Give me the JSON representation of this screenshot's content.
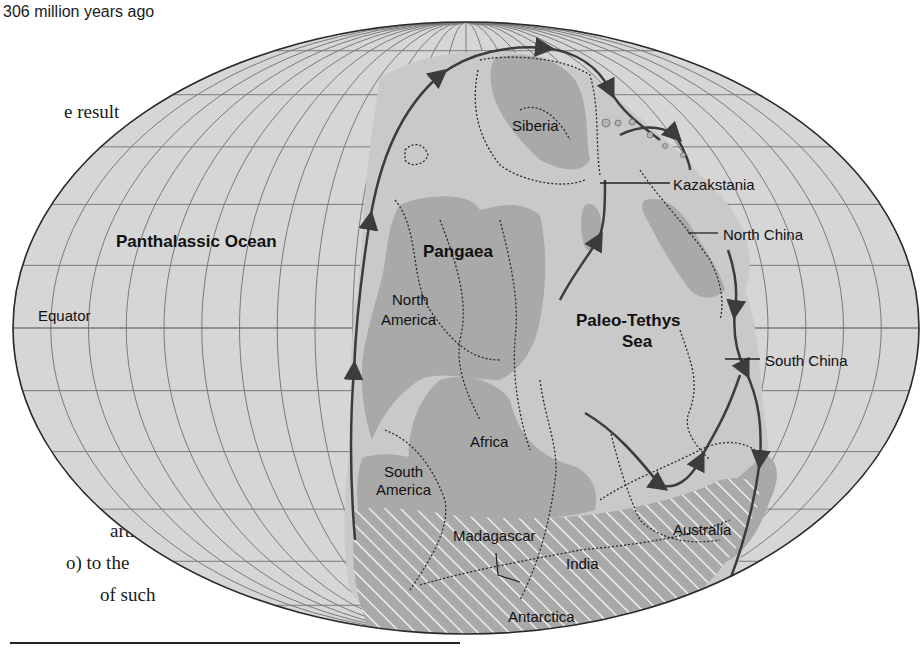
{
  "figure": {
    "caption": "306 million years ago",
    "colors": {
      "ocean": "#d6d6d6",
      "land": "#a9a9a9",
      "shelf": "#c9c9c9",
      "grid": "#7a7a7a",
      "outline": "#2a2a2a",
      "subduction": "#3c3c3c",
      "glacier_hatch": "#ffffff",
      "label": "#111111"
    },
    "projection": {
      "type": "Mollweide-like ellipse",
      "center_x": 466,
      "center_y": 328,
      "rx": 453,
      "ry": 306,
      "latitude_spacing_deg": 15,
      "longitude_spacing_deg": 15
    }
  },
  "body_text_fragments": [
    {
      "text": "e result",
      "x": 64,
      "y": 115
    },
    {
      "text": "also",
      "x": 104,
      "y": 148
    },
    {
      "text": "ds",
      "x": 114,
      "y": 181
    },
    {
      "text": "s",
      "x": 134,
      "y": 214
    },
    {
      "text": "r",
      "x": 132,
      "y": 472
    },
    {
      "text": "arth's",
      "x": 110,
      "y": 534
    },
    {
      "text": "o) to the",
      "x": 66,
      "y": 566
    },
    {
      "text": "of such",
      "x": 100,
      "y": 598
    }
  ],
  "labels": {
    "equator": "Equator",
    "panthalassic": "Panthalassic Ocean",
    "pangaea": "Pangaea",
    "paleo_tethys_1": "Paleo-Tethys",
    "paleo_tethys_2": "Sea",
    "siberia": "Siberia",
    "kazakstania": "Kazakstania",
    "north_china": "North China",
    "south_china": "South China",
    "north_america_1": "North",
    "north_america_2": "America",
    "south_america_1": "South",
    "south_america_2": "America",
    "africa": "Africa",
    "madagascar": "Madagascar",
    "india": "India",
    "australia": "Australia",
    "antarctica": "Antarctica"
  },
  "legend_features": [
    {
      "name": "land",
      "meaning": "exposed continental land (dark gray)"
    },
    {
      "name": "shelf",
      "meaning": "continental shelf / shallow sea (dashed outline)"
    },
    {
      "name": "subduction",
      "meaning": "subduction zone (line with triangular teeth)"
    },
    {
      "name": "glaciation",
      "meaning": "glaciated region (white diagonal hatching)"
    }
  ]
}
